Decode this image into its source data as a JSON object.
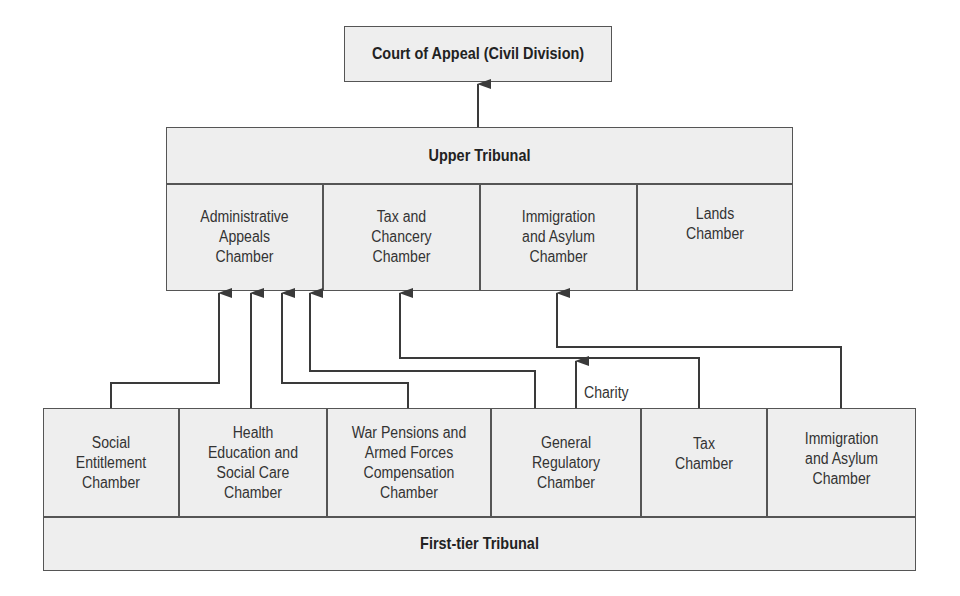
{
  "court_of_appeal": {
    "label": "Court of Appeal (Civil Division)"
  },
  "upper_tribunal": {
    "label": "Upper Tribunal",
    "chambers": [
      "Administrative\nAppeals\nChamber",
      "Tax and\nChancery\nChamber",
      "Immigration\nand Asylum\nChamber",
      "Lands\nChamber"
    ]
  },
  "first_tier_tribunal": {
    "label": "First-tier Tribunal",
    "chambers": [
      "Social\nEntitlement\nChamber",
      "Health\nEducation and\nSocial Care\nChamber",
      "War Pensions and\nArmed Forces\nCompensation\nChamber",
      "General\nRegulatory\nChamber",
      "Tax\nChamber",
      "Immigration\nand Asylum\nChamber"
    ]
  },
  "annotations": {
    "charity": "Charity"
  },
  "edges": [
    {
      "from": "Upper Tribunal",
      "to": "Court of Appeal (Civil Division)"
    },
    {
      "from": "Social Entitlement Chamber",
      "to": "Administrative Appeals Chamber"
    },
    {
      "from": "Health Education and Social Care Chamber",
      "to": "Administrative Appeals Chamber"
    },
    {
      "from": "War Pensions and Armed Forces Compensation Chamber",
      "to": "Administrative Appeals Chamber"
    },
    {
      "from": "General Regulatory Chamber",
      "to": "Administrative Appeals Chamber"
    },
    {
      "from": "Tax Chamber",
      "to": "Tax and Chancery Chamber"
    },
    {
      "from": "General Regulatory Chamber",
      "to": "Tax and Chancery Chamber",
      "label": "Charity"
    },
    {
      "from": "Immigration and Asylum Chamber (First-tier)",
      "to": "Immigration and Asylum Chamber (Upper)"
    }
  ]
}
